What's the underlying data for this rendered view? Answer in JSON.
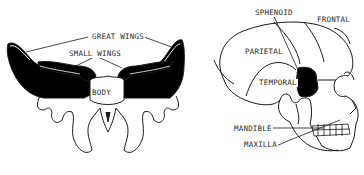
{
  "figure": {
    "left_panel": {
      "title": "Sphenoid bone",
      "labels": {
        "great_wings": "GREAT WINGS",
        "small_wings": "SMALL WINGS",
        "body": "BODY"
      }
    },
    "right_panel": {
      "title": "Skull lateral view",
      "labels": {
        "sphenoid": "SPHENOID",
        "frontal": "FRONTAL",
        "parietal": "PARIETAL",
        "temporal": "TEMPORAL",
        "mandible": "MANDIBLE",
        "maxilla": "MAXILLA"
      },
      "highlight_color": "#000000"
    },
    "colors": {
      "ink": "#1a1a1a",
      "background": "#ffffff"
    }
  }
}
